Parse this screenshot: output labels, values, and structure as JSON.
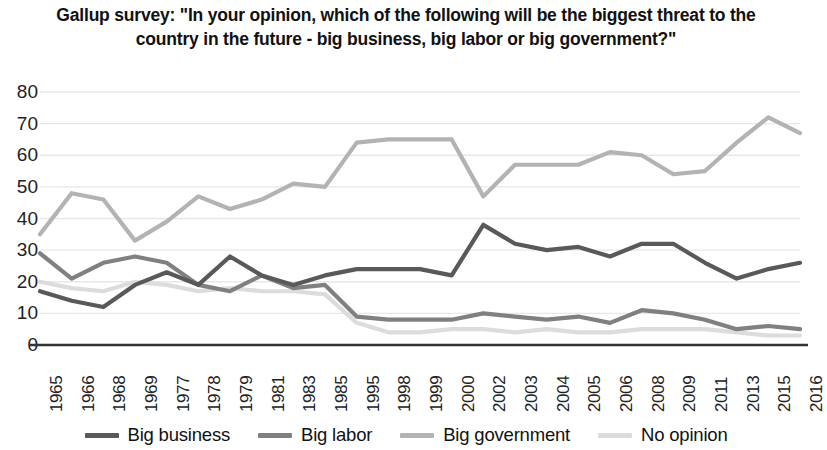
{
  "chart_data": {
    "type": "line",
    "title": "Gallup survey: \"In your opinion, which of the following will be the biggest threat to the country in the future - big business, big labor or big government?\"",
    "xlabel": "",
    "ylabel": "",
    "ylim": [
      0,
      80
    ],
    "ytick_step": 10,
    "yticks": [
      80,
      70,
      60,
      50,
      40,
      30,
      20,
      10,
      0
    ],
    "grid": true,
    "legend_position": "bottom",
    "categories": [
      "1965",
      "1966",
      "1968",
      "1969",
      "1977",
      "1978",
      "1979",
      "1981",
      "1983",
      "1985",
      "1995",
      "1998",
      "1999",
      "2000",
      "2002",
      "2003",
      "2004",
      "2005",
      "2006",
      "2008",
      "2009",
      "2011",
      "2013",
      "2015",
      "2016"
    ],
    "series": [
      {
        "name": "Big business",
        "color": "#595959",
        "values": [
          17,
          14,
          12,
          19,
          23,
          19,
          28,
          22,
          19,
          22,
          24,
          24,
          24,
          22,
          38,
          32,
          30,
          31,
          28,
          32,
          32,
          26,
          21,
          24,
          26
        ]
      },
      {
        "name": "Big labor",
        "color": "#808080",
        "values": [
          29,
          21,
          26,
          28,
          26,
          19,
          17,
          22,
          18,
          19,
          9,
          8,
          8,
          8,
          10,
          9,
          8,
          9,
          7,
          11,
          10,
          8,
          5,
          6,
          5
        ]
      },
      {
        "name": "Big government",
        "color": "#b3b3b3",
        "values": [
          35,
          48,
          46,
          33,
          39,
          47,
          43,
          46,
          51,
          50,
          64,
          65,
          65,
          65,
          47,
          57,
          57,
          57,
          61,
          60,
          54,
          55,
          64,
          72,
          67
        ]
      },
      {
        "name": "No opinion",
        "color": "#dcdcdc",
        "values": [
          20,
          18,
          17,
          20,
          19,
          17,
          18,
          17,
          17,
          16,
          7,
          4,
          4,
          5,
          5,
          4,
          5,
          4,
          4,
          5,
          5,
          5,
          4,
          3,
          3
        ]
      }
    ]
  },
  "legend": {
    "items": [
      {
        "label": "Big business",
        "color": "#595959"
      },
      {
        "label": "Big labor",
        "color": "#808080"
      },
      {
        "label": "Big government",
        "color": "#b3b3b3"
      },
      {
        "label": "No opinion",
        "color": "#dcdcdc"
      }
    ]
  },
  "axes": {
    "y_tick_labels": [
      "80",
      "70",
      "60",
      "50",
      "40",
      "30",
      "20",
      "10",
      "0"
    ],
    "x_tick_labels": [
      "1965",
      "1966",
      "1968",
      "1969",
      "1977",
      "1978",
      "1979",
      "1981",
      "1983",
      "1985",
      "1995",
      "1998",
      "1999",
      "2000",
      "2002",
      "2003",
      "2004",
      "2005",
      "2006",
      "2008",
      "2009",
      "2011",
      "2013",
      "2015",
      "2016"
    ]
  },
  "style": {
    "grid_color": "#e8e8e8",
    "axis_color": "#333333",
    "text_color": "#111111"
  }
}
